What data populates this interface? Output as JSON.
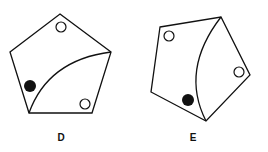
{
  "figures": [
    {
      "label": "D",
      "shape": "pentagon",
      "stroke_color": "#111111",
      "vertices": [
        [
          60,
          14
        ],
        [
          111,
          52
        ],
        [
          92,
          113
        ],
        [
          29,
          113
        ],
        [
          10,
          52
        ]
      ],
      "curve": {
        "from": [
          29,
          113
        ],
        "control": [
          48,
          60
        ],
        "to": [
          111,
          52
        ]
      },
      "circles": [
        {
          "type": "open",
          "cx": 61,
          "cy": 27,
          "r": 5
        },
        {
          "type": "filled",
          "cx": 30,
          "cy": 86,
          "r": 6
        },
        {
          "type": "open",
          "cx": 85,
          "cy": 104,
          "r": 5
        }
      ]
    },
    {
      "label": "E",
      "shape": "pentagon",
      "stroke_color": "#111111",
      "vertices": [
        [
          160,
          27
        ],
        [
          221,
          17
        ],
        [
          250,
          75
        ],
        [
          206,
          121
        ],
        [
          151,
          92
        ]
      ],
      "curve": {
        "from": [
          221,
          17
        ],
        "control": [
          180,
          70
        ],
        "to": [
          206,
          121
        ]
      },
      "circles": [
        {
          "type": "open",
          "cx": 169,
          "cy": 36,
          "r": 5
        },
        {
          "type": "filled",
          "cx": 188,
          "cy": 100,
          "r": 6
        },
        {
          "type": "open",
          "cx": 239,
          "cy": 72,
          "r": 5
        }
      ]
    }
  ]
}
